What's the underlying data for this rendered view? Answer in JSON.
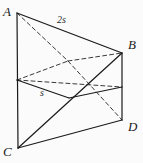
{
  "figure": {
    "kind": "solid-geometry-diagram",
    "background_color": "#fbfbfb",
    "stroke_color": "#1a1a1a",
    "dash_color": "#3a3a3a",
    "vertices": [
      {
        "name": "A",
        "label": "A",
        "x": 17,
        "y": 13,
        "label_x": 3,
        "label_y": 5
      },
      {
        "name": "B",
        "label": "B",
        "x": 122,
        "y": 53,
        "label_x": 128,
        "label_y": 38
      },
      {
        "name": "C",
        "label": "C",
        "x": 18,
        "y": 148,
        "label_x": 3,
        "label_y": 145
      },
      {
        "name": "D",
        "label": "D",
        "x": 122,
        "y": 120,
        "label_x": 128,
        "label_y": 120
      },
      {
        "name": "E",
        "label": "",
        "x": 17,
        "y": 80,
        "label_x": 0,
        "label_y": 0
      },
      {
        "name": "F",
        "label": "",
        "x": 122,
        "y": 87,
        "label_x": 0,
        "label_y": 0
      },
      {
        "name": "G",
        "label": "",
        "x": 68,
        "y": 61,
        "label_x": 0,
        "label_y": 0
      },
      {
        "name": "H",
        "label": "",
        "x": 69,
        "y": 98,
        "label_x": 0,
        "label_y": 0
      }
    ],
    "edge_labels": [
      {
        "name": "top-edge-length",
        "text": "2s",
        "x": 57,
        "y": 15
      },
      {
        "name": "mid-edge-length",
        "text": "s",
        "x": 40,
        "y": 88
      }
    ],
    "solid_edges": [
      {
        "name": "edge-A-C",
        "from": "A",
        "to": "C"
      },
      {
        "name": "edge-A-B",
        "from": "A",
        "to": "B"
      },
      {
        "name": "edge-B-D",
        "from": "B",
        "to": "D"
      },
      {
        "name": "edge-C-D",
        "from": "C",
        "to": "D"
      },
      {
        "name": "edge-C-B",
        "from": "C",
        "to": "B"
      },
      {
        "name": "edge-E-H",
        "from": "E",
        "to": "H"
      },
      {
        "name": "edge-H-F",
        "from": "H",
        "to": "F"
      }
    ],
    "dashed_edges": [
      {
        "name": "hidden-edge-A-G",
        "from": "A",
        "to": "G"
      },
      {
        "name": "hidden-edge-E-G",
        "from": "E",
        "to": "G"
      },
      {
        "name": "hidden-edge-G-B",
        "from": "G",
        "to": "B"
      },
      {
        "name": "hidden-edge-E-F",
        "from": "E",
        "to": "F"
      },
      {
        "name": "hidden-edge-G-D",
        "from": "G",
        "to": "D"
      }
    ]
  }
}
